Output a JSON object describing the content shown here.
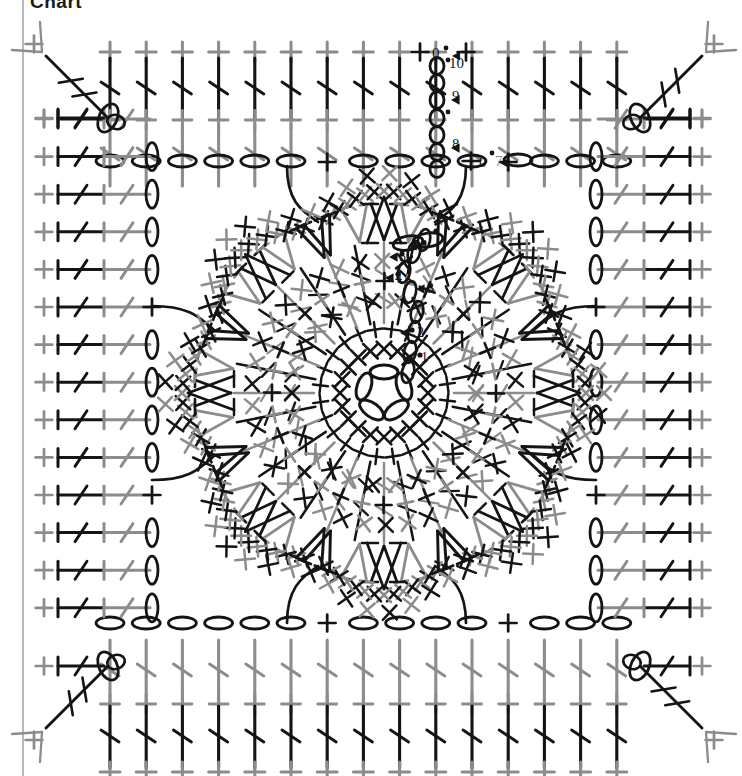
{
  "title": "Chart",
  "colors": {
    "dark": "#141414",
    "mid": "#3a3a3a",
    "gray": "#8c8c8c",
    "light_gray": "#a8a8a8",
    "rule": "#b9b9b9",
    "background": "#ffffff"
  },
  "chart_data": {
    "type": "diagram",
    "title": "Chart",
    "xlabel": "",
    "ylabel": "",
    "grid": false,
    "legend": "none",
    "symbol_key": [
      {
        "name": "chain-stitch",
        "glyph": "oval",
        "meaning": "ch"
      },
      {
        "name": "single-crochet",
        "glyph": "+",
        "meaning": "sc"
      },
      {
        "name": "double-crochet",
        "glyph": "post-with-slash",
        "meaning": "dc"
      },
      {
        "name": "treble-crochet",
        "glyph": "post-with-double-slash",
        "meaning": "tr"
      },
      {
        "name": "v-stitch",
        "glyph": "V",
        "meaning": "2 dc in same st"
      },
      {
        "name": "cross-stitch",
        "glyph": "x",
        "meaning": "x"
      },
      {
        "name": "slip-stitch",
        "glyph": "dot",
        "meaning": "sl st"
      },
      {
        "name": "round-start-arrow",
        "glyph": "triangle",
        "meaning": "round start"
      }
    ],
    "round_labels": [
      "1",
      "2",
      "3",
      "4",
      "5",
      "6",
      "7",
      "8",
      "9",
      "10"
    ],
    "rounds": [
      {
        "number": 1,
        "color": "dark",
        "x": 421,
        "y": 362
      },
      {
        "number": 2,
        "color": "dark",
        "x": 417,
        "y": 337
      },
      {
        "number": 3,
        "color": "dark",
        "x": 427,
        "y": 293
      },
      {
        "number": 4,
        "color": "dark",
        "x": 395,
        "y": 282
      },
      {
        "number": 5,
        "color": "dark",
        "x": 399,
        "y": 261
      },
      {
        "number": 6,
        "color": "dark",
        "x": 420,
        "y": 250
      },
      {
        "number": 7,
        "color": "gray",
        "x": 495,
        "y": 166
      },
      {
        "number": 8,
        "color": "dark",
        "x": 452,
        "y": 149
      },
      {
        "number": 9,
        "color": "dark",
        "x": 452,
        "y": 101
      },
      {
        "number": 10,
        "color": "dark",
        "x": 449,
        "y": 68
      }
    ],
    "petals": 8,
    "square_border_rows": 5,
    "center_ring_chains": 5,
    "radial_spokes": 32
  },
  "labels": {
    "r1": "1",
    "r2": "2",
    "r3": "3",
    "r4": "4",
    "r5": "5",
    "r6": "6",
    "r7": "7",
    "r8": "8",
    "r9": "9",
    "r10": "10"
  }
}
